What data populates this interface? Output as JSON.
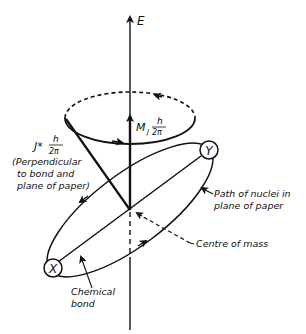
{
  "diagram": {
    "axis_label": "E",
    "mj_label": "M",
    "mj_subscript": "J",
    "mj_numerator": "h",
    "mj_denominator": "2π",
    "j_label": "J*",
    "j_numerator": "h",
    "j_denominator": "2π",
    "j_note_line1": "(Perpendicular",
    "j_note_line2": "to bond and",
    "j_note_line3": "plane of paper)",
    "path_label_line1": "Path of nuclei in",
    "path_label_line2": "plane of paper",
    "com_label": "Centre of mass",
    "bond_label_line1": "Chemical",
    "bond_label_line2": "bond",
    "nucleus_x": "X",
    "nucleus_y": "Y"
  },
  "colors": {
    "ink": "#111111",
    "background": "#ffffff"
  }
}
